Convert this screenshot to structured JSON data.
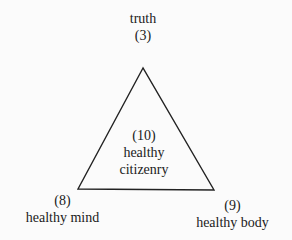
{
  "diagram": {
    "shape": "triangle",
    "top": {
      "label": "truth",
      "number": "(3)"
    },
    "center": {
      "number": "(10)",
      "line1": "healthy",
      "line2": "citizenry"
    },
    "bottom_left": {
      "number": "(8)",
      "label": "healthy mind"
    },
    "bottom_right": {
      "number": "(9)",
      "label": "healthy body"
    },
    "colors": {
      "line": "#222222",
      "background": "#fbfbfb"
    }
  }
}
